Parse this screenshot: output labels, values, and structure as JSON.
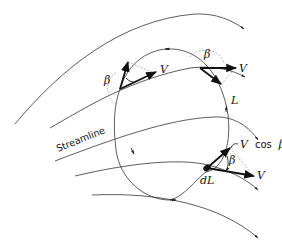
{
  "figure": {
    "labels": {
      "streamline": "Streamline",
      "velocity": "V",
      "beta": "β",
      "curve": "L",
      "element": "dL",
      "component_v": "V",
      "component_cos": "cos",
      "component_beta": "β"
    },
    "colors": {
      "line": "#333333",
      "vector": "#111111",
      "construction": "#888888",
      "background": "#ffffff"
    }
  }
}
